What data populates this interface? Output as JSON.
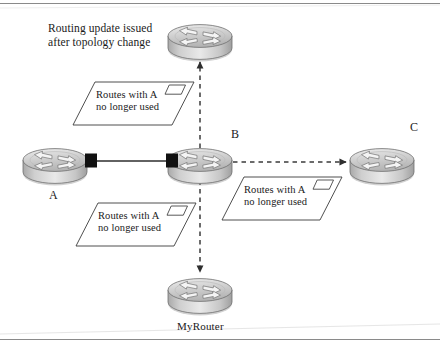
{
  "figure": {
    "caption_note": "Routing update issued\nafter topology change",
    "callouts": [
      {
        "id": "top",
        "text": "Routes with A\nno longer used",
        "icon": "parallelogram-icon"
      },
      {
        "id": "bottom",
        "text": "Routes with A\nno longer used",
        "icon": "parallelogram-icon"
      },
      {
        "id": "right",
        "text": "Routes with A\nno longer used",
        "icon": "parallelogram-icon"
      }
    ],
    "nodes": [
      {
        "id": "top",
        "label": "",
        "icon": "router-icon"
      },
      {
        "id": "a",
        "label": "A",
        "icon": "router-icon"
      },
      {
        "id": "b",
        "label": "B",
        "icon": "router-icon"
      },
      {
        "id": "c",
        "label": "C",
        "icon": "router-icon"
      },
      {
        "id": "myrouter",
        "label": "MyRouter",
        "icon": "router-icon"
      }
    ],
    "links": [
      {
        "from": "a",
        "to": "b",
        "style": "solid",
        "arrow": "none"
      },
      {
        "from": "b",
        "to": "c",
        "style": "dashed",
        "arrow": "to"
      },
      {
        "from": "b",
        "to": "top",
        "style": "dashed",
        "arrow": "to"
      },
      {
        "from": "b",
        "to": "myrouter",
        "style": "dashed",
        "arrow": "to"
      }
    ],
    "colors": {
      "line": "#3b3b3b",
      "frame": "#8a8a8a",
      "router_body": "#c9c9c9",
      "router_top": "#d8d8d8",
      "connector": "#111111",
      "text": "#1a1a1a"
    }
  }
}
